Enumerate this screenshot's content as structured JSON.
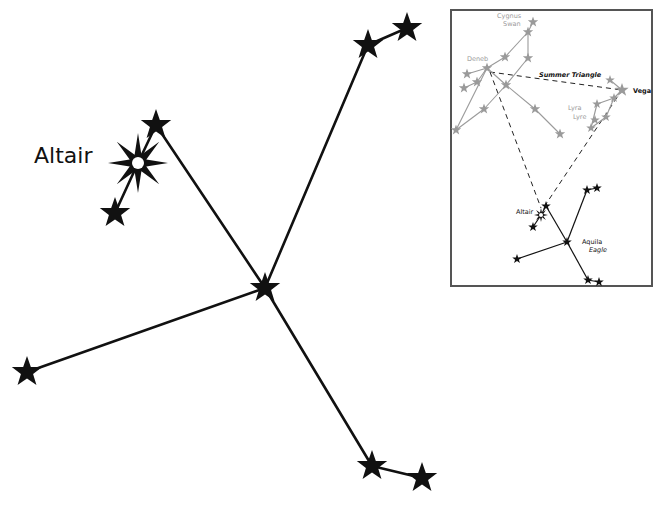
{
  "main": {
    "title_label": "Altair",
    "line_color": "#111111",
    "star_color": "#111111",
    "stars": [
      {
        "name": "altair",
        "x": 138,
        "y": 163,
        "type": "bright"
      },
      {
        "name": "tarazed",
        "x": 156,
        "y": 125,
        "type": "star"
      },
      {
        "name": "alshain",
        "x": 115,
        "y": 213,
        "type": "star"
      },
      {
        "name": "center",
        "x": 265,
        "y": 288,
        "type": "star"
      },
      {
        "name": "upper-right-1",
        "x": 368,
        "y": 45,
        "type": "star"
      },
      {
        "name": "upper-right-2",
        "x": 407,
        "y": 28,
        "type": "star"
      },
      {
        "name": "left",
        "x": 27,
        "y": 372,
        "type": "star"
      },
      {
        "name": "lower-right-1",
        "x": 372,
        "y": 466,
        "type": "star"
      },
      {
        "name": "lower-right-2",
        "x": 422,
        "y": 478,
        "type": "star"
      }
    ],
    "lines": [
      [
        115,
        213,
        138,
        163
      ],
      [
        138,
        163,
        156,
        125
      ],
      [
        156,
        125,
        265,
        288
      ],
      [
        265,
        288,
        368,
        45
      ],
      [
        368,
        45,
        407,
        28
      ],
      [
        265,
        288,
        27,
        372
      ],
      [
        265,
        288,
        372,
        466
      ],
      [
        372,
        466,
        422,
        478
      ]
    ]
  },
  "inset": {
    "frame": {
      "x": 451,
      "y": 10,
      "width": 201,
      "height": 276,
      "border_color": "#555555"
    },
    "labels": {
      "cygnus": "Cygnus",
      "cygnus_common": "Swan",
      "deneb": "Deneb",
      "summer_triangle": "Summer Triangle",
      "vega": "Vega",
      "lyra": "Lyra",
      "lyra_common": "Lyre",
      "altair": "Altair",
      "aquila": "Aquila",
      "aquila_common": "Eagle"
    },
    "colors": {
      "faint": "#9a9a9a",
      "dark": "#111111"
    },
    "cygnus_stars": [
      [
        533,
        22
      ],
      [
        528,
        32
      ],
      [
        505,
        57
      ],
      [
        528,
        58
      ],
      [
        487,
        68
      ],
      [
        467,
        74
      ],
      [
        464,
        88
      ],
      [
        477,
        82
      ],
      [
        506,
        85
      ],
      [
        484,
        109
      ],
      [
        535,
        109
      ],
      [
        560,
        134
      ],
      [
        456,
        130
      ]
    ],
    "cygnus_lines": [
      [
        533,
        22,
        528,
        32
      ],
      [
        528,
        32,
        505,
        57
      ],
      [
        505,
        57,
        487,
        68
      ],
      [
        528,
        32,
        528,
        58
      ],
      [
        528,
        58,
        506,
        85
      ],
      [
        506,
        85,
        484,
        109
      ],
      [
        484,
        109,
        456,
        130
      ],
      [
        487,
        68,
        467,
        74
      ],
      [
        487,
        68,
        477,
        82
      ],
      [
        477,
        82,
        464,
        88
      ],
      [
        487,
        68,
        506,
        85
      ],
      [
        506,
        85,
        535,
        109
      ],
      [
        535,
        109,
        560,
        134
      ],
      [
        487,
        68,
        456,
        130
      ]
    ],
    "lyra_stars": [
      [
        610,
        80
      ],
      [
        622,
        90
      ],
      [
        614,
        98
      ],
      [
        597,
        104
      ],
      [
        595,
        120
      ],
      [
        591,
        128
      ],
      [
        606,
        117
      ]
    ],
    "lyra_lines": [
      [
        610,
        80,
        622,
        90
      ],
      [
        622,
        90,
        614,
        98
      ],
      [
        614,
        98,
        597,
        104
      ],
      [
        597,
        104,
        591,
        128
      ],
      [
        614,
        98,
        606,
        117
      ],
      [
        591,
        128,
        606,
        117
      ]
    ],
    "aquila_stars": [
      [
        546,
        206
      ],
      [
        533,
        227
      ],
      [
        567,
        242
      ],
      [
        587,
        190
      ],
      [
        597,
        188
      ],
      [
        517,
        259
      ],
      [
        588,
        280
      ],
      [
        599,
        282
      ]
    ],
    "aquila_bright": [
      541,
      215
    ],
    "aquila_lines": [
      [
        533,
        227,
        541,
        215
      ],
      [
        541,
        215,
        546,
        206
      ],
      [
        546,
        206,
        567,
        242
      ],
      [
        567,
        242,
        587,
        190
      ],
      [
        587,
        190,
        597,
        188
      ],
      [
        567,
        242,
        517,
        259
      ],
      [
        567,
        242,
        588,
        280
      ],
      [
        588,
        280,
        599,
        282
      ]
    ],
    "triangle_lines": [
      [
        490,
        72,
        622,
        90
      ],
      [
        490,
        72,
        541,
        208
      ],
      [
        622,
        90,
        546,
        204
      ]
    ]
  }
}
